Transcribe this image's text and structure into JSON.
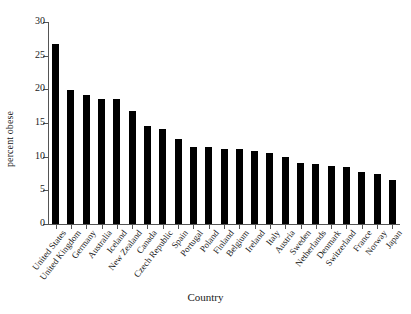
{
  "chart_data": {
    "type": "bar",
    "title": "",
    "xlabel": "Country",
    "ylabel": "percent obese",
    "ylim": [
      0,
      30
    ],
    "yticks": [
      0,
      5,
      10,
      15,
      20,
      25,
      30
    ],
    "ytick_labels": [
      "0",
      "5",
      "10",
      "15",
      "20",
      "25",
      "30"
    ],
    "grid": false,
    "legend": null,
    "bar_color": "#000000",
    "axis_color": "#555555",
    "categories": [
      "United States",
      "United Kingdom",
      "Germany",
      "Australia",
      "Iceland",
      "New Zealand",
      "Canada",
      "Czech Republic",
      "Spain",
      "Portugal",
      "Poland",
      "Finland",
      "Belgium",
      "Ireland",
      "Italy",
      "Austria",
      "Sweden",
      "Netherlands",
      "Denmark",
      "Switzerland",
      "France",
      "Norway",
      "Japan"
    ],
    "values": [
      26.7,
      19.9,
      19.2,
      18.5,
      18.5,
      16.8,
      14.5,
      14.1,
      12.7,
      11.5,
      11.4,
      11.2,
      11.1,
      10.9,
      10.5,
      9.9,
      9.1,
      8.9,
      8.6,
      8.5,
      7.7,
      7.5,
      6.5
    ]
  }
}
